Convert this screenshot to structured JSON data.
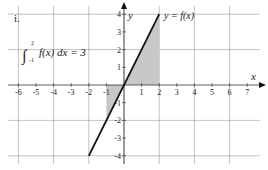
{
  "chart_data": {
    "type": "line",
    "title": "",
    "problem_label": "i.",
    "xlabel": "x",
    "ylabel": "y",
    "xlim": [
      -6.5,
      7.6
    ],
    "ylim": [
      -4.2,
      4.1
    ],
    "x_ticks": [
      -6,
      -5,
      -4,
      -3,
      -2,
      -1,
      1,
      2,
      3,
      4,
      5,
      6,
      7
    ],
    "y_ticks": [
      -4,
      -3,
      -2,
      -1,
      1,
      2,
      3,
      4
    ],
    "grid": true,
    "grid_spacing": 2,
    "series": [
      {
        "name": "y = f(x)",
        "equation": "f(x) = 2x",
        "x": [
          -2,
          2
        ],
        "y": [
          -4,
          4
        ],
        "color": "#111111"
      }
    ],
    "shaded_regions": [
      {
        "from_x": -1,
        "to_x": 0,
        "under": "f(x)",
        "color": "#c8c8c8"
      },
      {
        "from_x": 0,
        "to_x": 2,
        "under": "f(x)",
        "color": "#c8c8c8"
      }
    ],
    "annotations": [
      {
        "text": "y = f(x)",
        "at": [
          2.1,
          3.9
        ]
      },
      {
        "text": "∫₋₁² f(x) dx = 3",
        "lower": "-1",
        "upper": "2",
        "integrand": "f(x) dx",
        "value": "= 3"
      }
    ]
  },
  "labels": {
    "problem": "i.",
    "curve": "y = f(x)",
    "integral_upper": "2",
    "integral_lower": "-1",
    "integral_body": "f(x) dx = 3",
    "x_axis": "x",
    "y_axis": "y"
  },
  "colors": {
    "grid": "#9a9a9a",
    "axis": "#333333",
    "line": "#111111",
    "shade": "#c8c8c8"
  }
}
